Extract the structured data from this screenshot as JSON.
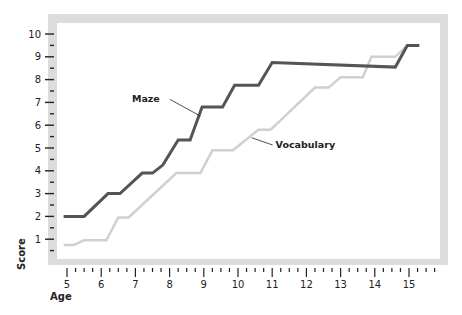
{
  "chart_data": {
    "type": "line",
    "title": "",
    "xlabel": "Age",
    "ylabel": "Score",
    "xlim": [
      4.8,
      15.8
    ],
    "ylim": [
      0,
      10.5
    ],
    "x_ticks": [
      5,
      6,
      7,
      8,
      9,
      10,
      11,
      12,
      13,
      14,
      15
    ],
    "y_ticks": [
      1,
      2,
      3,
      4,
      5,
      6,
      7,
      8,
      9,
      10
    ],
    "x_minor_per_major": 3,
    "y_minor_per_major": 1,
    "grid": false,
    "legend": "inline labels",
    "series": [
      {
        "name": "Maze",
        "color": "#555555",
        "stroke_width": 3,
        "label_pos": {
          "x": 6.9,
          "y": 7.0
        },
        "label_anchor_point": {
          "x": 8.9,
          "y": 6.4
        },
        "points": [
          [
            4.9,
            2.0
          ],
          [
            5.5,
            2.0
          ],
          [
            6.2,
            3.0
          ],
          [
            6.55,
            3.0
          ],
          [
            7.2,
            3.9
          ],
          [
            7.5,
            3.9
          ],
          [
            7.8,
            4.25
          ],
          [
            8.25,
            5.35
          ],
          [
            8.6,
            5.35
          ],
          [
            8.95,
            6.8
          ],
          [
            9.55,
            6.8
          ],
          [
            9.9,
            7.75
          ],
          [
            10.6,
            7.75
          ],
          [
            11.0,
            8.75
          ],
          [
            14.6,
            8.55
          ],
          [
            14.95,
            9.5
          ],
          [
            15.3,
            9.5
          ]
        ]
      },
      {
        "name": "Vocabulary",
        "color": "#d0d0d0",
        "stroke_width": 2.5,
        "label_pos": {
          "x": 11.1,
          "y": 5.0
        },
        "label_anchor_point": {
          "x": 10.4,
          "y": 5.45
        },
        "points": [
          [
            4.9,
            0.75
          ],
          [
            5.2,
            0.75
          ],
          [
            5.5,
            0.95
          ],
          [
            6.15,
            0.95
          ],
          [
            6.5,
            1.95
          ],
          [
            6.8,
            1.95
          ],
          [
            8.2,
            3.9
          ],
          [
            8.9,
            3.9
          ],
          [
            9.25,
            4.9
          ],
          [
            9.85,
            4.9
          ],
          [
            10.6,
            5.8
          ],
          [
            10.95,
            5.8
          ],
          [
            12.25,
            7.65
          ],
          [
            12.65,
            7.65
          ],
          [
            13.0,
            8.1
          ],
          [
            13.65,
            8.1
          ],
          [
            13.9,
            9.0
          ],
          [
            14.6,
            9.0
          ],
          [
            14.95,
            9.5
          ],
          [
            15.3,
            9.5
          ]
        ]
      }
    ]
  },
  "frame": {
    "color": "#dcdcdc"
  }
}
